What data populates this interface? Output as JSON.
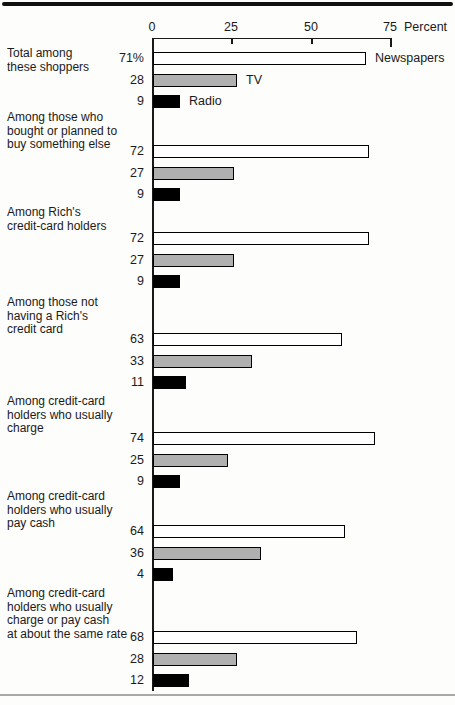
{
  "chart_data": {
    "type": "bar",
    "orientation": "horizontal",
    "title": "",
    "axis": {
      "label": "Percent",
      "ticks": [
        "0",
        "25",
        "50",
        "75"
      ],
      "tick_values": [
        0,
        25,
        50,
        75
      ],
      "max": 75,
      "grid": false
    },
    "legend_position": "beside-first-group-bars",
    "series": [
      {
        "name": "Newspapers",
        "color": "#ffffff"
      },
      {
        "name": "TV",
        "color": "#b0b0b0"
      },
      {
        "name": "Radio",
        "color": "#000000"
      }
    ],
    "groups": [
      {
        "label": "Total among these shoppers",
        "label_lines": [
          "Total among",
          "these shoppers"
        ],
        "values": [
          71,
          28,
          9
        ],
        "value_labels": [
          "71%",
          "28",
          "9"
        ]
      },
      {
        "label": "Among those who bought or planned to buy something else",
        "label_lines": [
          "Among those who",
          "bought or planned to",
          "buy something else"
        ],
        "values": [
          72,
          27,
          9
        ],
        "value_labels": [
          "72",
          "27",
          "9"
        ]
      },
      {
        "label": "Among Rich's credit-card holders",
        "label_lines": [
          "Among Rich's",
          "credit-card holders"
        ],
        "values": [
          72,
          27,
          9
        ],
        "value_labels": [
          "72",
          "27",
          "9"
        ]
      },
      {
        "label": "Among those not having a Rich's credit card",
        "label_lines": [
          "Among those not",
          "having a Rich's",
          "credit card"
        ],
        "values": [
          63,
          33,
          11
        ],
        "value_labels": [
          "63",
          "33",
          "11"
        ]
      },
      {
        "label": "Among credit-card holders who usually charge",
        "label_lines": [
          "Among credit-card",
          "holders who usually",
          "charge"
        ],
        "values": [
          74,
          25,
          9
        ],
        "value_labels": [
          "74",
          "25",
          "9"
        ]
      },
      {
        "label": "Among credit-card holders who usually pay cash",
        "label_lines": [
          "Among credit-card",
          "holders who usually",
          "pay cash"
        ],
        "values": [
          64,
          36,
          4
        ],
        "value_labels": [
          "64",
          "36",
          "4"
        ]
      },
      {
        "label": "Among credit-card holders who usually charge or pay cash at about the same rate",
        "label_lines": [
          "Among credit-card",
          "holders who usually",
          "charge or pay cash",
          "at about the same rate"
        ],
        "values": [
          68,
          28,
          12
        ],
        "value_labels": [
          "68",
          "28",
          "12"
        ]
      }
    ]
  }
}
